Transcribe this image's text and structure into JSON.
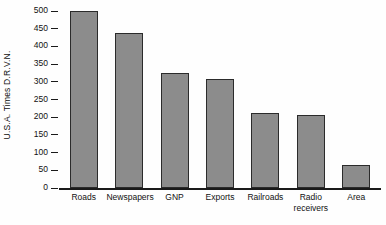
{
  "chart_data": {
    "type": "bar",
    "title": "",
    "xlabel": "",
    "ylabel": "U.S.A. Times D.R.V.N.",
    "ylim": [
      0,
      520
    ],
    "yticks": [
      0,
      50,
      100,
      150,
      200,
      250,
      300,
      350,
      400,
      450,
      500
    ],
    "ytick_labels": [
      "0",
      "50",
      "100",
      "150",
      "200",
      "250",
      "300",
      "350",
      "400",
      "450",
      "500"
    ],
    "grid": false,
    "legend": null,
    "bar_color": "#8c8c8c",
    "bar_edge_color": "#2b2b2b",
    "axis_color": "#1a1a1a",
    "categories": [
      "Roads",
      "Newspapers",
      "GNP",
      "Exports",
      "Railroads",
      "Radio\nreceivers",
      "Area"
    ],
    "values": [
      500,
      437,
      325,
      308,
      212,
      205,
      65
    ]
  }
}
